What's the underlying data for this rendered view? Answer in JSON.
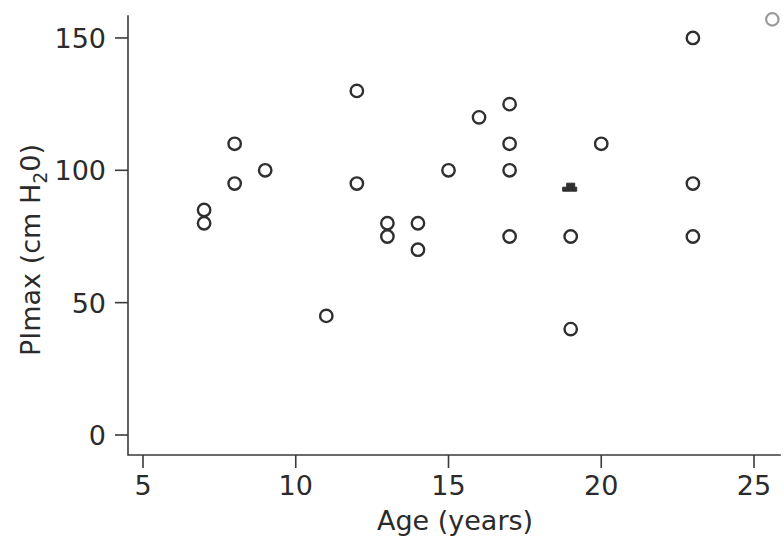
{
  "chart_data": {
    "type": "scatter",
    "title": "",
    "xlabel": "Age (years)",
    "ylabel": "PImax (cm H₂0)",
    "ylabel_parts": {
      "prefix": "PImax  (cm  H",
      "subscript": "2",
      "suffix": "0)"
    },
    "xlim": [
      5,
      25
    ],
    "ylim": [
      0,
      157
    ],
    "xticks": [
      5,
      10,
      15,
      20,
      25
    ],
    "xtick_labels": [
      "5",
      "10",
      "15",
      "20",
      "25"
    ],
    "yticks": [
      0,
      50,
      100,
      150
    ],
    "ytick_labels": [
      "0",
      "50",
      "100",
      "150"
    ],
    "grid": false,
    "legend": "none",
    "marker": "open-circle",
    "marker_color": "#2f2f2f",
    "n_points": 25,
    "x": [
      7,
      7,
      8,
      8,
      9,
      11,
      12,
      12,
      13,
      13,
      14,
      14,
      15,
      16,
      16,
      17,
      17,
      17,
      17,
      19,
      19,
      19,
      20,
      23,
      23,
      23
    ],
    "y": [
      80,
      85,
      95,
      110,
      100,
      45,
      95,
      130,
      75,
      80,
      70,
      80,
      100,
      120,
      120,
      75,
      100,
      110,
      125,
      40,
      75,
      94,
      110,
      75,
      95,
      150
    ],
    "points": [
      {
        "x": 7,
        "y": 85,
        "style": "open"
      },
      {
        "x": 7,
        "y": 80,
        "style": "open"
      },
      {
        "x": 8,
        "y": 110,
        "style": "open"
      },
      {
        "x": 8,
        "y": 95,
        "style": "open"
      },
      {
        "x": 9,
        "y": 100,
        "style": "open"
      },
      {
        "x": 11,
        "y": 45,
        "style": "open"
      },
      {
        "x": 12,
        "y": 130,
        "style": "open"
      },
      {
        "x": 12,
        "y": 95,
        "style": "open"
      },
      {
        "x": 13,
        "y": 80,
        "style": "open"
      },
      {
        "x": 13,
        "y": 75,
        "style": "open"
      },
      {
        "x": 14,
        "y": 80,
        "style": "open"
      },
      {
        "x": 14,
        "y": 70,
        "style": "open"
      },
      {
        "x": 15,
        "y": 100,
        "style": "open"
      },
      {
        "x": 16,
        "y": 120,
        "style": "open"
      },
      {
        "x": 17,
        "y": 125,
        "style": "open"
      },
      {
        "x": 17,
        "y": 110,
        "style": "open"
      },
      {
        "x": 17,
        "y": 100,
        "style": "open"
      },
      {
        "x": 17,
        "y": 75,
        "style": "open"
      },
      {
        "x": 19,
        "y": 94,
        "style": "filled-dash"
      },
      {
        "x": 19,
        "y": 75,
        "style": "open"
      },
      {
        "x": 19,
        "y": 40,
        "style": "open"
      },
      {
        "x": 20,
        "y": 110,
        "style": "open"
      },
      {
        "x": 23,
        "y": 150,
        "style": "open"
      },
      {
        "x": 23,
        "y": 95,
        "style": "open"
      },
      {
        "x": 23,
        "y": 75,
        "style": "open"
      }
    ],
    "edge_artifact": {
      "present": true,
      "x": 25.6,
      "y": 157
    }
  }
}
